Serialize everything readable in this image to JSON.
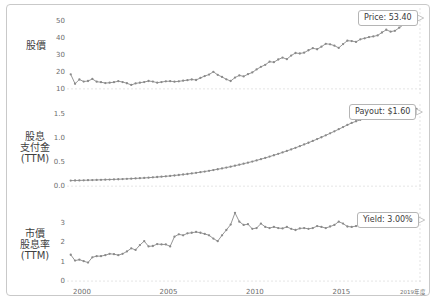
{
  "figure": {
    "border_color": "#c9c9c9",
    "series_color": "#8a8a8a",
    "grid_color": "#d8d8d8"
  },
  "panels": {
    "price": {
      "label": "股價",
      "yticks": [
        "50",
        "40",
        "30",
        "20",
        "10"
      ],
      "callout": "Price: 53.40"
    },
    "payout": {
      "label_line1": "股息",
      "label_line2": "支付金",
      "label_line3": "(TTM)",
      "yticks": [
        "1.5",
        "1.0",
        "0.5",
        "0.0"
      ],
      "callout": "Payout: $1.60"
    },
    "yield": {
      "label_line1": "市價",
      "label_line2": "股息率",
      "label_line3": "(TTM)",
      "yticks": [
        "3",
        "2",
        "1",
        "0"
      ],
      "callout": "Yield: 3.00%"
    }
  },
  "xaxis": {
    "ticks": [
      "2000",
      "2005",
      "2010",
      "2015"
    ],
    "last_tick": "2019年度"
  },
  "chart_data": {
    "type": "line",
    "title": "",
    "xlabel": "",
    "grid": true,
    "legend": "none",
    "xlim": [
      1999.3,
      2019.6
    ],
    "x": [
      1999.4,
      1999.65,
      1999.9,
      2000.15,
      2000.4,
      2000.65,
      2000.9,
      2001.15,
      2001.4,
      2001.65,
      2001.9,
      2002.15,
      2002.4,
      2002.65,
      2002.9,
      2003.15,
      2003.4,
      2003.65,
      2003.9,
      2004.15,
      2004.4,
      2004.65,
      2004.9,
      2005.15,
      2005.4,
      2005.65,
      2005.9,
      2006.15,
      2006.4,
      2006.65,
      2006.9,
      2007.15,
      2007.4,
      2007.65,
      2007.9,
      2008.15,
      2008.4,
      2008.65,
      2008.9,
      2009.15,
      2009.4,
      2009.65,
      2009.9,
      2010.15,
      2010.4,
      2010.65,
      2010.9,
      2011.15,
      2011.4,
      2011.65,
      2011.9,
      2012.15,
      2012.4,
      2012.65,
      2012.9,
      2013.15,
      2013.4,
      2013.65,
      2013.9,
      2014.15,
      2014.4,
      2014.65,
      2014.9,
      2015.15,
      2015.4,
      2015.65,
      2015.9,
      2016.15,
      2016.4,
      2016.65,
      2016.9,
      2017.15,
      2017.4,
      2017.65,
      2017.9,
      2018.15,
      2018.4,
      2018.65,
      2018.9,
      2019.15,
      2019.4
    ],
    "series": [
      {
        "name": "股價",
        "panel": "price",
        "ylabel": "股價",
        "ylim": [
          7,
          55
        ],
        "yticks": [
          10,
          20,
          30,
          40,
          50
        ],
        "values": [
          18.5,
          13.0,
          15.5,
          14.3,
          14.6,
          15.8,
          14.2,
          13.9,
          13.4,
          13.6,
          13.9,
          14.5,
          14.0,
          13.3,
          12.3,
          13.2,
          13.6,
          14.0,
          14.6,
          14.3,
          13.6,
          14.0,
          14.4,
          14.5,
          14.2,
          14.4,
          14.8,
          15.1,
          15.5,
          15.2,
          16.4,
          17.5,
          18.4,
          20.0,
          18.2,
          17.0,
          15.6,
          14.6,
          16.6,
          17.9,
          17.3,
          18.6,
          19.6,
          21.4,
          22.9,
          24.1,
          25.9,
          25.6,
          27.2,
          28.3,
          27.4,
          29.5,
          31.0,
          30.7,
          31.2,
          32.6,
          33.8,
          33.2,
          34.7,
          36.4,
          36.1,
          35.3,
          34.0,
          36.2,
          38.2,
          38.0,
          37.5,
          39.0,
          39.6,
          40.3,
          40.7,
          41.3,
          43.0,
          44.6,
          43.5,
          44.0,
          45.8,
          47.6,
          49.2,
          51.0,
          53.4
        ],
        "end_annotation": "Price: 53.40"
      },
      {
        "name": "股息支付金 (TTM)",
        "panel": "payout",
        "ylabel": "股息支付金 (TTM)",
        "ylim": [
          -0.08,
          1.62
        ],
        "yticks": [
          0.0,
          0.5,
          1.0,
          1.5
        ],
        "values": [
          0.115,
          0.117,
          0.119,
          0.121,
          0.124,
          0.126,
          0.128,
          0.131,
          0.134,
          0.137,
          0.14,
          0.143,
          0.147,
          0.151,
          0.155,
          0.16,
          0.165,
          0.17,
          0.176,
          0.182,
          0.189,
          0.196,
          0.204,
          0.212,
          0.221,
          0.231,
          0.241,
          0.252,
          0.264,
          0.276,
          0.289,
          0.303,
          0.318,
          0.334,
          0.35,
          0.367,
          0.385,
          0.404,
          0.424,
          0.444,
          0.465,
          0.487,
          0.51,
          0.534,
          0.559,
          0.585,
          0.612,
          0.64,
          0.669,
          0.699,
          0.73,
          0.762,
          0.795,
          0.829,
          0.864,
          0.9,
          0.937,
          0.975,
          1.014,
          1.054,
          1.095,
          1.137,
          1.18,
          1.224,
          1.269,
          1.31,
          1.345,
          1.375,
          1.4,
          1.425,
          1.448,
          1.468,
          1.487,
          1.505,
          1.522,
          1.538,
          1.552,
          1.565,
          1.577,
          1.589,
          1.6
        ],
        "end_annotation": "Payout: $1.60"
      },
      {
        "name": "市價股息率 (TTM)",
        "panel": "yield",
        "ylabel": "市價股息率 (TTM)",
        "ylim": [
          -0.15,
          3.75
        ],
        "yticks": [
          0,
          1,
          2,
          3
        ],
        "values": [
          1.35,
          1.05,
          1.1,
          1.02,
          0.95,
          1.22,
          1.28,
          1.28,
          1.33,
          1.4,
          1.38,
          1.33,
          1.4,
          1.52,
          1.68,
          1.6,
          1.85,
          2.05,
          1.78,
          1.8,
          1.9,
          1.88,
          1.88,
          1.78,
          2.28,
          2.4,
          2.35,
          2.45,
          2.48,
          2.52,
          2.48,
          2.42,
          2.35,
          2.18,
          2.05,
          2.35,
          2.62,
          2.9,
          3.5,
          3.05,
          2.88,
          2.92,
          2.68,
          2.72,
          2.95,
          2.78,
          2.72,
          2.78,
          2.72,
          2.7,
          2.78,
          2.68,
          2.62,
          2.7,
          2.72,
          2.68,
          2.72,
          2.82,
          2.78,
          2.72,
          2.8,
          2.88,
          3.05,
          2.95,
          2.8,
          2.78,
          2.82,
          2.88,
          2.98,
          3.12,
          3.05,
          3.0,
          2.95,
          3.02,
          3.08,
          3.12,
          3.05,
          3.02,
          3.08,
          3.05,
          3.0
        ],
        "end_annotation": "Yield: 3.00%"
      }
    ]
  }
}
